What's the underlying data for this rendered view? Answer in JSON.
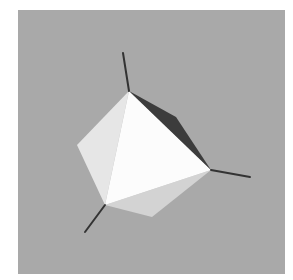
{
  "scene": {
    "description": "Rendered 3D octahedron with three protruding axis lines on a gray background",
    "colors": {
      "page_background": "#ffffff",
      "panel_background": "#a9a9a9",
      "front_face": "#fcfcfc",
      "left_face": "#e6e6e6",
      "bottom_face": "#d3d3d3",
      "dark_face": "#3c3c3c",
      "axis_line": "#333333"
    },
    "panel": {
      "x": 18,
      "y": 10,
      "width": 267,
      "height": 264
    },
    "vertices": {
      "top": [
        129,
        91
      ],
      "left": [
        77,
        145
      ],
      "bottom_left": [
        105,
        205
      ],
      "bottom": [
        152,
        217
      ],
      "right": [
        211,
        170
      ],
      "dark_mid": [
        176,
        117
      ]
    },
    "axes": [
      {
        "name": "top-axis",
        "from": [
          129,
          91
        ],
        "to": [
          123,
          53
        ]
      },
      {
        "name": "right-axis",
        "from": [
          211,
          170
        ],
        "to": [
          250,
          177
        ]
      },
      {
        "name": "bottom-left-axis",
        "from": [
          105,
          205
        ],
        "to": [
          85,
          232
        ]
      }
    ]
  }
}
